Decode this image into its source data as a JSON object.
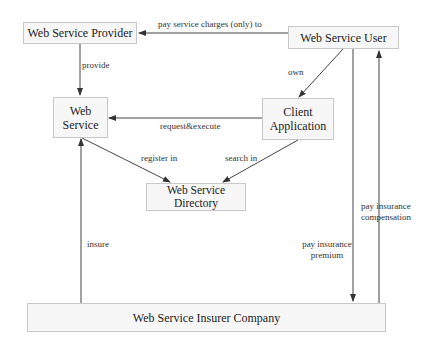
{
  "diagram": {
    "type": "architecture-flow",
    "nodes": [
      {
        "id": "provider",
        "label": "Web Service Provider"
      },
      {
        "id": "user",
        "label": "Web Service User"
      },
      {
        "id": "service",
        "label": "Web\nService",
        "line1": "Web",
        "line2": "Service"
      },
      {
        "id": "client",
        "label": "Client\nApplication",
        "line1": "Client",
        "line2": "Application"
      },
      {
        "id": "directory",
        "label": "Web Service\nDirectory",
        "line1": "Web Service",
        "line2": "Directory"
      },
      {
        "id": "insurer",
        "label": "Web Service Insurer Company"
      }
    ],
    "edges": [
      {
        "from": "user",
        "to": "provider",
        "label": "pay service charges (only) to"
      },
      {
        "from": "provider",
        "to": "service",
        "label": "provide"
      },
      {
        "from": "user",
        "to": "client",
        "label": "own"
      },
      {
        "from": "client",
        "to": "service",
        "label": "request&execute"
      },
      {
        "from": "service",
        "to": "directory",
        "label": "register in"
      },
      {
        "from": "client",
        "to": "directory",
        "label": "search in"
      },
      {
        "from": "insurer",
        "to": "service",
        "label": "insure"
      },
      {
        "from": "user",
        "to": "insurer",
        "label": "pay insurance\npremium",
        "line1": "pay insurance",
        "line2": "premium"
      },
      {
        "from": "insurer",
        "to": "user",
        "label": "pay insurance\ncompensation",
        "line1": "pay insurance",
        "line2": "compensation"
      }
    ],
    "colors": {
      "node_fill": "#f7f7f7",
      "node_border": "#c8c8c8",
      "edge": "#333333",
      "text": "#1a1a1a"
    }
  }
}
